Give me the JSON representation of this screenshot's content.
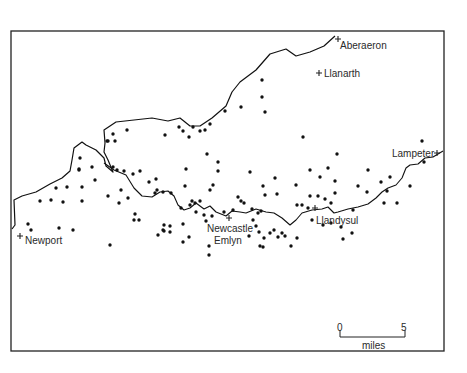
{
  "map": {
    "towns": [
      {
        "name": "Aberaeron",
        "x": 338,
        "y": 39,
        "label_x": 340,
        "label_y": 49
      },
      {
        "name": "Llanarth",
        "x": 319,
        "y": 73,
        "label_x": 324,
        "label_y": 77
      },
      {
        "name": "Lampeter",
        "x": 437,
        "y": 153,
        "label_x": 392,
        "label_y": 157
      },
      {
        "name": "Newport",
        "x": 20,
        "y": 236,
        "label_x": 25,
        "label_y": 244
      },
      {
        "name": "Llandysul",
        "x": 315,
        "y": 208,
        "label_x": 316,
        "label_y": 224
      },
      {
        "name": "Newcastle Emlyn",
        "x": 229,
        "y": 218,
        "label_x": 207,
        "label_y": 232,
        "lines": [
          "Newcastle",
          "Emlyn"
        ]
      }
    ],
    "scale_bar": {
      "start_label": "0",
      "end_label": "5",
      "unit_label": "miles"
    },
    "dots": [
      [
        262,
        80
      ],
      [
        262,
        97
      ],
      [
        265,
        112
      ],
      [
        225,
        111
      ],
      [
        241,
        107
      ],
      [
        127,
        130
      ],
      [
        113,
        134
      ],
      [
        115,
        141
      ],
      [
        107,
        141
      ],
      [
        108,
        141
      ],
      [
        179,
        127
      ],
      [
        183,
        131
      ],
      [
        189,
        137
      ],
      [
        193,
        127
      ],
      [
        200,
        131
      ],
      [
        205,
        130
      ],
      [
        210,
        124
      ],
      [
        165,
        135
      ],
      [
        303,
        137
      ],
      [
        422,
        141
      ],
      [
        207,
        154
      ],
      [
        218,
        162
      ],
      [
        218,
        171
      ],
      [
        80,
        158
      ],
      [
        92,
        167
      ],
      [
        79,
        170
      ],
      [
        95,
        180
      ],
      [
        113,
        167
      ],
      [
        117,
        170
      ],
      [
        124,
        171
      ],
      [
        133,
        174
      ],
      [
        140,
        171
      ],
      [
        156,
        179
      ],
      [
        149,
        182
      ],
      [
        157,
        190
      ],
      [
        155,
        193
      ],
      [
        163,
        192
      ],
      [
        171,
        193
      ],
      [
        186,
        169
      ],
      [
        185,
        186
      ],
      [
        213,
        185
      ],
      [
        210,
        190
      ],
      [
        250,
        172
      ],
      [
        275,
        178
      ],
      [
        263,
        186
      ],
      [
        265,
        195
      ],
      [
        277,
        194
      ],
      [
        310,
        170
      ],
      [
        320,
        177
      ],
      [
        328,
        168
      ],
      [
        335,
        181
      ],
      [
        335,
        193
      ],
      [
        310,
        196
      ],
      [
        318,
        196
      ],
      [
        368,
        170
      ],
      [
        358,
        186
      ],
      [
        367,
        192
      ],
      [
        381,
        182
      ],
      [
        390,
        177
      ],
      [
        387,
        191
      ],
      [
        424,
        162
      ],
      [
        410,
        186
      ],
      [
        397,
        203
      ],
      [
        384,
        203
      ],
      [
        296,
        185
      ],
      [
        337,
        154
      ],
      [
        325,
        199
      ],
      [
        331,
        203
      ],
      [
        40,
        201
      ],
      [
        51,
        200
      ],
      [
        63,
        202
      ],
      [
        56,
        188
      ],
      [
        67,
        187
      ],
      [
        82,
        201
      ],
      [
        82,
        187
      ],
      [
        79,
        169
      ],
      [
        108,
        196
      ],
      [
        121,
        190
      ],
      [
        128,
        198
      ],
      [
        119,
        203
      ],
      [
        135,
        214
      ],
      [
        134,
        220
      ],
      [
        139,
        220
      ],
      [
        28,
        224
      ],
      [
        31,
        230
      ],
      [
        59,
        228
      ],
      [
        73,
        230
      ],
      [
        110,
        245
      ],
      [
        158,
        235
      ],
      [
        164,
        225
      ],
      [
        163,
        230
      ],
      [
        170,
        226
      ],
      [
        164,
        231
      ],
      [
        170,
        232
      ],
      [
        183,
        224
      ],
      [
        190,
        205
      ],
      [
        192,
        201
      ],
      [
        196,
        212
      ],
      [
        200,
        201
      ],
      [
        181,
        208
      ],
      [
        195,
        203
      ],
      [
        204,
        215
      ],
      [
        206,
        221
      ],
      [
        212,
        216
      ],
      [
        224,
        212
      ],
      [
        233,
        210
      ],
      [
        238,
        197
      ],
      [
        241,
        201
      ],
      [
        244,
        203
      ],
      [
        252,
        209
      ],
      [
        258,
        213
      ],
      [
        261,
        211
      ],
      [
        253,
        220
      ],
      [
        256,
        226
      ],
      [
        259,
        232
      ],
      [
        249,
        236
      ],
      [
        264,
        238
      ],
      [
        270,
        233
      ],
      [
        274,
        230
      ],
      [
        278,
        237
      ],
      [
        282,
        233
      ],
      [
        285,
        236
      ],
      [
        291,
        246
      ],
      [
        297,
        238
      ],
      [
        297,
        205
      ],
      [
        302,
        205
      ],
      [
        308,
        208
      ],
      [
        312,
        220
      ],
      [
        323,
        225
      ],
      [
        331,
        223
      ],
      [
        341,
        227
      ],
      [
        343,
        239
      ],
      [
        352,
        233
      ],
      [
        353,
        210
      ],
      [
        189,
        237
      ],
      [
        183,
        242
      ],
      [
        209,
        246
      ],
      [
        209,
        255
      ],
      [
        260,
        246
      ],
      [
        263,
        247
      ]
    ],
    "coast_path": "M12,229 L15,225 L14,200 L22,196 L36,192 L50,184 L62,178 L70,171 L72,160 L74,148 L82,142 L86,145 L96,150 L104,158 L106,166 L113,172 L108,160 L104,152 L105,143 L104,130 L116,122 L134,120 L152,118 L168,121 L180,118 L190,126 L200,126 L212,118 L226,106 L232,92 L240,82 L256,70 L270,54 L286,49 L296,56 L310,52 L324,46 L335,36",
    "river_path": "M104,163 L114,170 L126,175 L134,188 L142,196 L152,197 L160,192 L168,191 L174,196 L178,205 L184,210 L190,208 L196,203 L204,209 L210,206 L216,212 L226,216 L232,211 L240,212 L246,213 L256,209 L266,212 L274,213 L282,218 L290,225 L296,220 L302,213 L312,210 L322,209 L328,207 L334,213 L338,212 L348,209 L358,207 L368,204 L376,198 L382,192 L388,188 L396,185 L402,178 L406,168 L410,165 L418,164 L425,158 L433,157 L443,151"
  }
}
